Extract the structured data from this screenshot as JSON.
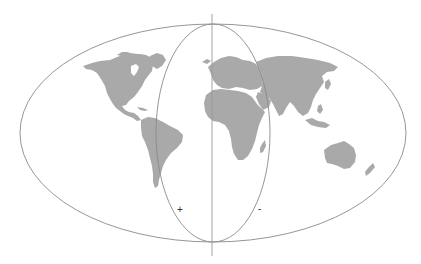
{
  "diagram": {
    "type": "world-map-projection",
    "projection": "Hammer / Aitoff-style equal-area world map",
    "colors": {
      "background": "#ffffff",
      "land": "#a9a9a9",
      "outline": "#8a8a8a",
      "meridian": "#9a9a9a",
      "label": "#333333"
    },
    "outer_ellipse": {
      "cx": 213,
      "cy": 133,
      "rx": 193,
      "ry": 109
    },
    "inner_ellipse": {
      "cx": 213,
      "cy": 133,
      "rx": 57,
      "ry": 109
    },
    "central_meridian": {
      "x": 212,
      "y1": 14,
      "y2": 256
    },
    "labels": {
      "plus": "+",
      "minus": "-"
    },
    "continents": [
      "North America",
      "South America",
      "Greenland",
      "Europe",
      "Africa",
      "Asia",
      "Australia",
      "Madagascar",
      "New Zealand",
      "Indonesia"
    ]
  }
}
